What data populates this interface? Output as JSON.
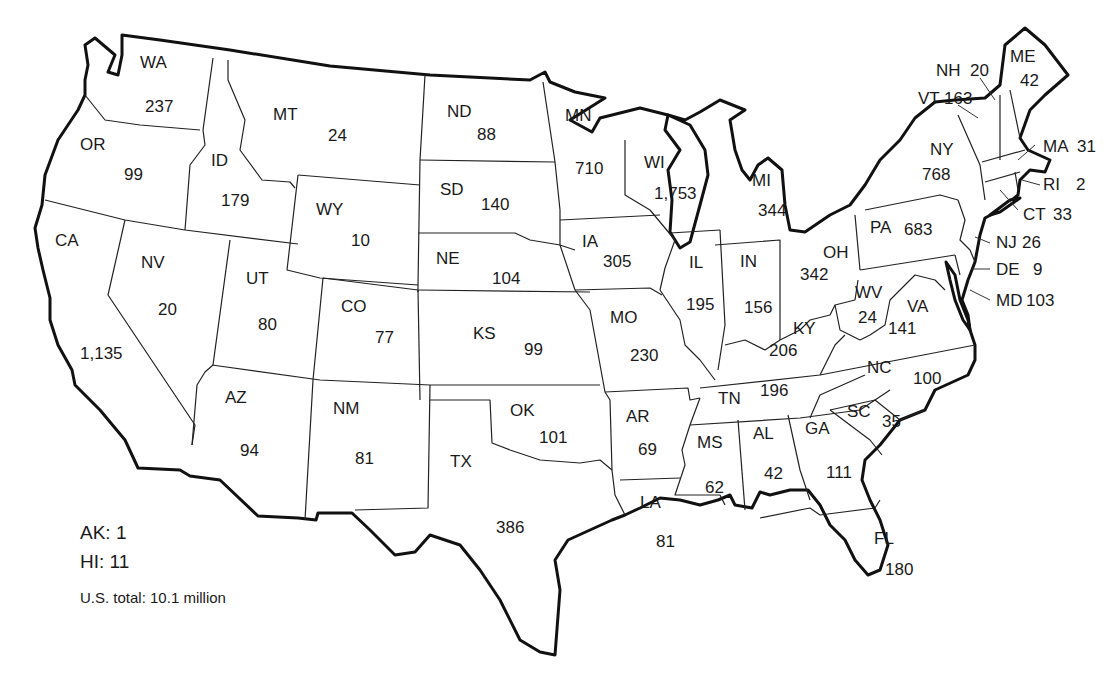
{
  "map": {
    "title": "",
    "region": "Contiguous United States",
    "colors": {
      "outline": "#111111",
      "border": "#222222",
      "fill": "#ffffff",
      "text": "#1a1a1a"
    }
  },
  "states": [
    {
      "abbr": "WA",
      "value": "237"
    },
    {
      "abbr": "OR",
      "value": "99"
    },
    {
      "abbr": "CA",
      "value": "1,135"
    },
    {
      "abbr": "ID",
      "value": "179"
    },
    {
      "abbr": "NV",
      "value": "20"
    },
    {
      "abbr": "MT",
      "value": "24"
    },
    {
      "abbr": "WY",
      "value": "10"
    },
    {
      "abbr": "UT",
      "value": "80"
    },
    {
      "abbr": "AZ",
      "value": "94"
    },
    {
      "abbr": "CO",
      "value": "77"
    },
    {
      "abbr": "NM",
      "value": "81"
    },
    {
      "abbr": "ND",
      "value": "88"
    },
    {
      "abbr": "SD",
      "value": "140"
    },
    {
      "abbr": "NE",
      "value": "104"
    },
    {
      "abbr": "KS",
      "value": "99"
    },
    {
      "abbr": "OK",
      "value": "101"
    },
    {
      "abbr": "TX",
      "value": "386"
    },
    {
      "abbr": "MN",
      "value": "710"
    },
    {
      "abbr": "IA",
      "value": "305"
    },
    {
      "abbr": "MO",
      "value": "230"
    },
    {
      "abbr": "AR",
      "value": "69"
    },
    {
      "abbr": "LA",
      "value": "81"
    },
    {
      "abbr": "WI",
      "value": "1,753"
    },
    {
      "abbr": "IL",
      "value": "195"
    },
    {
      "abbr": "MI",
      "value": "344"
    },
    {
      "abbr": "IN",
      "value": "156"
    },
    {
      "abbr": "OH",
      "value": "342"
    },
    {
      "abbr": "KY",
      "value": "206"
    },
    {
      "abbr": "TN",
      "value": "196"
    },
    {
      "abbr": "MS",
      "value": "62"
    },
    {
      "abbr": "AL",
      "value": "42"
    },
    {
      "abbr": "GA",
      "value": "111"
    },
    {
      "abbr": "FL",
      "value": "180"
    },
    {
      "abbr": "SC",
      "value": "35"
    },
    {
      "abbr": "NC",
      "value": "100"
    },
    {
      "abbr": "VA",
      "value": "141"
    },
    {
      "abbr": "WV",
      "value": "24"
    },
    {
      "abbr": "PA",
      "value": "683"
    },
    {
      "abbr": "NY",
      "value": "768"
    },
    {
      "abbr": "VT",
      "value": "163"
    },
    {
      "abbr": "NH",
      "value": "20"
    },
    {
      "abbr": "ME",
      "value": "42"
    },
    {
      "abbr": "MA",
      "value": "31"
    },
    {
      "abbr": "RI",
      "value": "2"
    },
    {
      "abbr": "CT",
      "value": "33"
    },
    {
      "abbr": "NJ",
      "value": "26"
    },
    {
      "abbr": "DE",
      "value": "9"
    },
    {
      "abbr": "MD",
      "value": "103"
    }
  ],
  "legend": {
    "ak": "AK: 1",
    "hi": "HI: 11",
    "total": "U.S. total: 10.1 million"
  }
}
